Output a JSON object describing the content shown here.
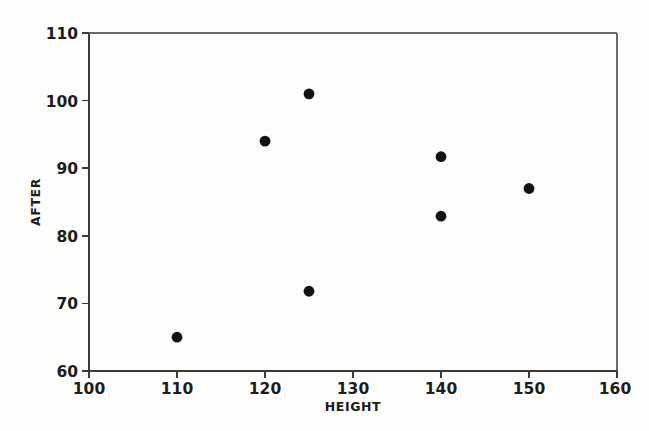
{
  "chart_data": {
    "type": "scatter",
    "title": "",
    "xlabel": "HEIGHT",
    "ylabel": "AFTER",
    "xlim": [
      100,
      160
    ],
    "ylim": [
      60,
      110
    ],
    "xticks": [
      100,
      110,
      120,
      130,
      140,
      150,
      160
    ],
    "xtick_labels": [
      "100",
      "110",
      "120",
      "130",
      "140",
      "150",
      "160"
    ],
    "yticks": [
      60,
      70,
      80,
      90,
      100,
      110
    ],
    "ytick_labels": [
      "60",
      "70",
      "80",
      "90",
      "100",
      "110"
    ],
    "grid": false,
    "legend": null,
    "marker": "filled-circle",
    "marker_color": "#121212",
    "points": [
      {
        "x": 110,
        "y": 65.0,
        "label": "point-110-65"
      },
      {
        "x": 120,
        "y": 94.0,
        "label": "point-120-94"
      },
      {
        "x": 125,
        "y": 101.0,
        "label": "point-125-101"
      },
      {
        "x": 125,
        "y": 71.8,
        "label": "point-125-71.8"
      },
      {
        "x": 140,
        "y": 91.7,
        "label": "point-140-91.7"
      },
      {
        "x": 140,
        "y": 82.9,
        "label": "point-140-82.9"
      },
      {
        "x": 150,
        "y": 87.0,
        "label": "point-150-87"
      }
    ],
    "series": [
      {
        "name": "AFTER vs HEIGHT",
        "x": [
          110,
          120,
          125,
          125,
          140,
          140,
          150
        ],
        "values": [
          65.0,
          94.0,
          101.0,
          71.8,
          91.7,
          82.9,
          87.0
        ]
      }
    ]
  },
  "colors": {
    "background": "#fdfdfc",
    "frame": "#6a6a6a",
    "axis": "#3a3a3a",
    "text": "#1c1c1c",
    "marker": "#121212"
  }
}
